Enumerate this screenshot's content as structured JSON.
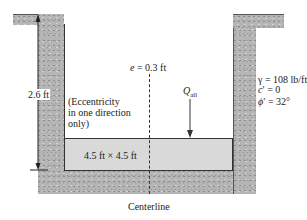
{
  "diagram": {
    "type": "eccentric-footing-cross-section",
    "dimension_label": "2.6 ft",
    "eccentricity_label": "e = 0.3 ft",
    "eccentricity_note": [
      "(Eccentricity",
      "in one direction",
      "only)"
    ],
    "load_label": "Q",
    "load_subscript": "all",
    "footing_label": "4.5 ft × 4.5 ft",
    "centerline_label": "Centerline",
    "soil_properties": [
      "γ = 108 lb/ft³",
      "c′ = 0",
      "ϕ′ = 32°"
    ],
    "colors": {
      "soil": "#b5b5b5",
      "footing": "#d9d9d9",
      "line": "#333333"
    }
  }
}
